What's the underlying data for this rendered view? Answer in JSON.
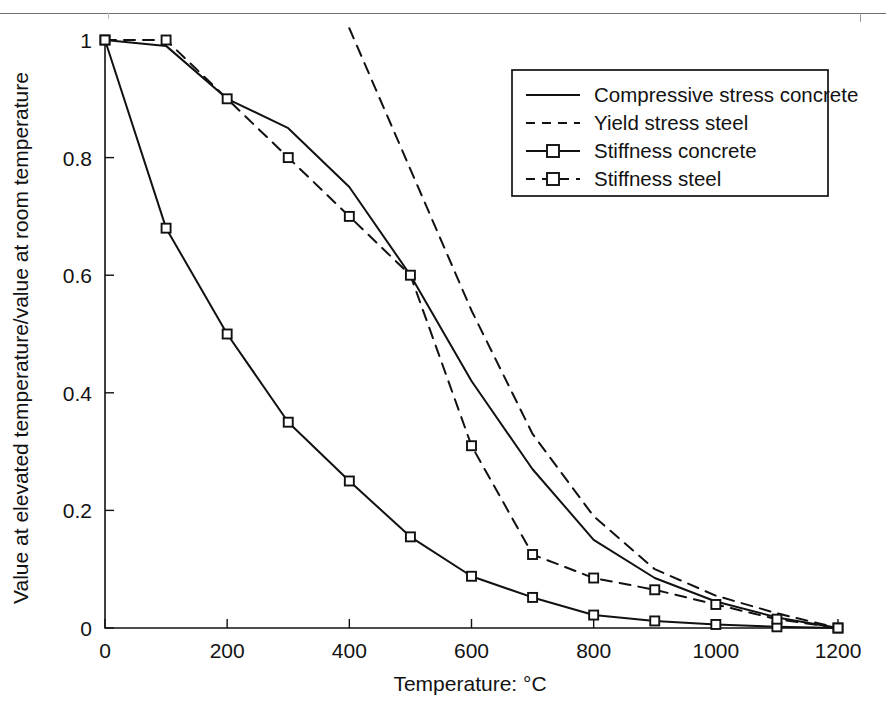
{
  "chart_data": {
    "type": "line",
    "title": "",
    "xlabel": "Temperature: °C",
    "ylabel": "Value at elevated temperature/value at room temperature",
    "xlim": [
      0,
      1200
    ],
    "ylim": [
      0,
      1
    ],
    "xticks": [
      0,
      200,
      400,
      600,
      800,
      1000,
      1200
    ],
    "xticklabels": [
      "0",
      "200",
      "400",
      "600",
      "800",
      "1000",
      "1200"
    ],
    "yticks": [
      0,
      0.2,
      0.4,
      0.6,
      0.8,
      1
    ],
    "yticklabels": [
      "0",
      "0.2",
      "0.4",
      "0.6",
      "0.8",
      "1"
    ],
    "grid": false,
    "legend_position": "upper right",
    "series": [
      {
        "name": "Compressive stress concrete",
        "style": "solid",
        "marker": "none",
        "x": [
          0,
          100,
          200,
          300,
          400,
          500,
          600,
          700,
          800,
          900,
          1000,
          1100,
          1200
        ],
        "y": [
          1.0,
          0.99,
          0.9,
          0.85,
          0.75,
          0.6,
          0.42,
          0.27,
          0.15,
          0.085,
          0.045,
          0.018,
          0.0
        ]
      },
      {
        "name": "Yield stress steel",
        "style": "dashed",
        "marker": "none",
        "x": [
          400,
          500,
          600,
          700,
          800,
          900,
          1000,
          1100,
          1200
        ],
        "y": [
          1.02,
          0.78,
          0.54,
          0.33,
          0.19,
          0.1,
          0.055,
          0.025,
          0.0
        ]
      },
      {
        "name": "Stiffness concrete",
        "style": "solid",
        "marker": "square",
        "x": [
          0,
          100,
          200,
          300,
          400,
          500,
          600,
          700,
          800,
          900,
          1000,
          1100,
          1200
        ],
        "y": [
          1.0,
          0.68,
          0.5,
          0.35,
          0.25,
          0.155,
          0.088,
          0.052,
          0.022,
          0.012,
          0.006,
          0.002,
          0.0
        ]
      },
      {
        "name": "Stiffness steel",
        "style": "dashed",
        "marker": "square",
        "x": [
          0,
          100,
          200,
          300,
          400,
          500,
          600,
          700,
          800,
          900,
          1000,
          1100,
          1200
        ],
        "y": [
          1.0,
          1.0,
          0.9,
          0.8,
          0.7,
          0.6,
          0.31,
          0.125,
          0.085,
          0.065,
          0.04,
          0.015,
          0.0
        ]
      }
    ]
  },
  "legend": {
    "items": [
      {
        "label": "Compressive stress concrete",
        "style": "solid",
        "marker": "none"
      },
      {
        "label": "Yield stress steel",
        "style": "dashed",
        "marker": "none"
      },
      {
        "label": "Stiffness concrete",
        "style": "solid",
        "marker": "square"
      },
      {
        "label": "Stiffness steel",
        "style": "dashed",
        "marker": "square"
      }
    ]
  }
}
